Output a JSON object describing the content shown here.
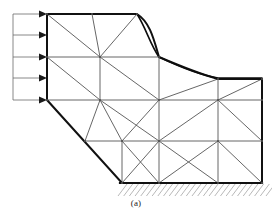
{
  "figure": {
    "caption": "(a)",
    "title_semantics": "finite-element-mesh-with-distributed-load",
    "colors": {
      "boundary": "#111111",
      "mesh_interior": "#555555",
      "load_arrow": "#1a1a1a",
      "load_frame": "#6b6b6b",
      "hatch": "#9a9a9a",
      "background": "#ffffff",
      "curve": "#0d0d0d"
    },
    "stroke_widths": {
      "boundary": 2.0,
      "mesh_interior": 0.9,
      "load_arrow": 1.0,
      "load_frame": 0.8,
      "hatch": 0.7,
      "curve": 1.6
    }
  },
  "load": {
    "label": "distributed-load",
    "arrow_count": 5,
    "direction": "right",
    "tail_x": 13,
    "head_x": 47,
    "arrow_y": [
      14,
      35,
      57,
      78,
      100
    ],
    "frame_top_y": 14,
    "frame_bottom_y": 100,
    "frame_x": 13
  },
  "geometry": {
    "boundary_outline": "47,14 137,14 C 150,22 154,40 159,57 C 180,66 200,74 218,79 L 262,79 L 262,183 L 122,183 L 47,100 Z",
    "support_line": {
      "x1": 120,
      "y1": 183,
      "x2": 262,
      "y2": 183
    },
    "nodes": [
      {
        "id": "n1",
        "x": 47,
        "y": 14
      },
      {
        "id": "n2",
        "x": 92,
        "y": 14
      },
      {
        "id": "n3",
        "x": 137,
        "y": 14
      },
      {
        "id": "n4",
        "x": 47,
        "y": 57
      },
      {
        "id": "n5",
        "x": 100,
        "y": 57
      },
      {
        "id": "n6",
        "x": 159,
        "y": 57
      },
      {
        "id": "n7",
        "x": 47,
        "y": 100
      },
      {
        "id": "n8",
        "x": 100,
        "y": 100
      },
      {
        "id": "n9",
        "x": 159,
        "y": 100
      },
      {
        "id": "n10",
        "x": 218,
        "y": 79
      },
      {
        "id": "n11",
        "x": 262,
        "y": 79
      },
      {
        "id": "n12",
        "x": 218,
        "y": 100
      },
      {
        "id": "n13",
        "x": 262,
        "y": 100
      },
      {
        "id": "n14",
        "x": 85,
        "y": 141
      },
      {
        "id": "n15",
        "x": 122,
        "y": 141
      },
      {
        "id": "n16",
        "x": 159,
        "y": 141
      },
      {
        "id": "n17",
        "x": 218,
        "y": 141
      },
      {
        "id": "n18",
        "x": 262,
        "y": 141
      },
      {
        "id": "n19",
        "x": 122,
        "y": 183
      },
      {
        "id": "n20",
        "x": 159,
        "y": 183
      },
      {
        "id": "n21",
        "x": 218,
        "y": 183
      },
      {
        "id": "n22",
        "x": 262,
        "y": 183
      }
    ],
    "interior_edges": [
      {
        "x1": 92,
        "y1": 14,
        "x2": 100,
        "y2": 57
      },
      {
        "x1": 47,
        "y1": 14,
        "x2": 100,
        "y2": 57
      },
      {
        "x1": 137,
        "y1": 14,
        "x2": 100,
        "y2": 57
      },
      {
        "x1": 47,
        "y1": 57,
        "x2": 100,
        "y2": 57
      },
      {
        "x1": 100,
        "y1": 57,
        "x2": 159,
        "y2": 57
      },
      {
        "x1": 47,
        "y1": 57,
        "x2": 100,
        "y2": 100
      },
      {
        "x1": 100,
        "y1": 57,
        "x2": 100,
        "y2": 100
      },
      {
        "x1": 100,
        "y1": 57,
        "x2": 159,
        "y2": 100
      },
      {
        "x1": 159,
        "y1": 57,
        "x2": 159,
        "y2": 100
      },
      {
        "x1": 47,
        "y1": 100,
        "x2": 100,
        "y2": 100
      },
      {
        "x1": 100,
        "y1": 100,
        "x2": 159,
        "y2": 100
      },
      {
        "x1": 159,
        "y1": 100,
        "x2": 218,
        "y2": 100
      },
      {
        "x1": 218,
        "y1": 100,
        "x2": 262,
        "y2": 100
      },
      {
        "x1": 218,
        "y1": 79,
        "x2": 218,
        "y2": 100
      },
      {
        "x1": 262,
        "y1": 79,
        "x2": 218,
        "y2": 100
      },
      {
        "x1": 159,
        "y1": 100,
        "x2": 218,
        "y2": 79
      },
      {
        "x1": 100,
        "y1": 100,
        "x2": 85,
        "y2": 141
      },
      {
        "x1": 100,
        "y1": 100,
        "x2": 122,
        "y2": 141
      },
      {
        "x1": 100,
        "y1": 100,
        "x2": 159,
        "y2": 141
      },
      {
        "x1": 159,
        "y1": 100,
        "x2": 122,
        "y2": 141
      },
      {
        "x1": 159,
        "y1": 100,
        "x2": 159,
        "y2": 141
      },
      {
        "x1": 85,
        "y1": 141,
        "x2": 122,
        "y2": 141
      },
      {
        "x1": 122,
        "y1": 141,
        "x2": 159,
        "y2": 141
      },
      {
        "x1": 159,
        "y1": 141,
        "x2": 218,
        "y2": 141
      },
      {
        "x1": 218,
        "y1": 141,
        "x2": 262,
        "y2": 141
      },
      {
        "x1": 218,
        "y1": 100,
        "x2": 159,
        "y2": 141
      },
      {
        "x1": 218,
        "y1": 100,
        "x2": 218,
        "y2": 141
      },
      {
        "x1": 218,
        "y1": 100,
        "x2": 262,
        "y2": 141
      },
      {
        "x1": 122,
        "y1": 141,
        "x2": 122,
        "y2": 183
      },
      {
        "x1": 122,
        "y1": 141,
        "x2": 159,
        "y2": 183
      },
      {
        "x1": 159,
        "y1": 141,
        "x2": 159,
        "y2": 183
      },
      {
        "x1": 159,
        "y1": 141,
        "x2": 122,
        "y2": 183
      },
      {
        "x1": 159,
        "y1": 141,
        "x2": 218,
        "y2": 183
      },
      {
        "x1": 218,
        "y1": 141,
        "x2": 218,
        "y2": 183
      },
      {
        "x1": 218,
        "y1": 141,
        "x2": 159,
        "y2": 183
      },
      {
        "x1": 218,
        "y1": 141,
        "x2": 262,
        "y2": 183
      },
      {
        "x1": 262,
        "y1": 141,
        "x2": 262,
        "y2": 183
      },
      {
        "x1": 262,
        "y1": 100,
        "x2": 262,
        "y2": 141
      },
      {
        "x1": 262,
        "y1": 79,
        "x2": 262,
        "y2": 100
      }
    ],
    "deflected_curve": "M 137,14 C 146,28 150,44 159,57 C 180,67 200,75 218,78 L 262,78"
  },
  "hatching": {
    "label": "ground-hatching",
    "x_start": 118,
    "x_end": 266,
    "y_top": 184,
    "y_bottom": 196,
    "line_count": 26,
    "slant_dx": 9
  }
}
